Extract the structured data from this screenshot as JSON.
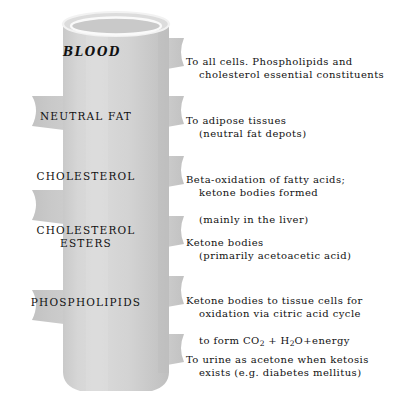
{
  "figure": {
    "vessel_label": "blood-vessel-cylinder",
    "colors": {
      "vessel_fill": "#d2d2d2",
      "vessel_shade": "#c4c4c4",
      "vessel_highlight": "#ededed",
      "rim_stroke": "#f5f5f5",
      "text": "#111111",
      "background": "#ffffff"
    }
  },
  "labels": [
    {
      "id": "blood",
      "text": "BLOOD",
      "style": "italic"
    },
    {
      "id": "neutral-fat",
      "text": "NEUTRAL  FAT",
      "style": "roman"
    },
    {
      "id": "cholesterol",
      "text": "CHOLESTEROL",
      "style": "roman"
    },
    {
      "id": "cholesterol-esters",
      "text": "CHOLESTEROL\nESTERS",
      "style": "roman"
    },
    {
      "id": "phospholipids",
      "text": "PHOSPHOLIPIDS",
      "style": "roman"
    }
  ],
  "descriptions": [
    {
      "id": "to-all-cells",
      "line1": "To all cells. Phospholipids and",
      "line2": "cholesterol essential constituents",
      "line3": "",
      "formula": false
    },
    {
      "id": "adipose-tissues",
      "line1": "To adipose tissues",
      "line2": "(neutral fat depots)",
      "line3": "",
      "formula": false
    },
    {
      "id": "beta-oxidation",
      "line1": "Beta-oxidation of fatty acids;",
      "line2": "ketone bodies formed",
      "line3": "(mainly in the liver)",
      "formula": false
    },
    {
      "id": "ketone-bodies",
      "line1": "Ketone bodies",
      "line2": "(primarily acetoacetic acid)",
      "line3": "",
      "formula": false
    },
    {
      "id": "citric-acid-cycle",
      "line1": "Ketone bodies to tissue cells for",
      "line2": "oxidation via citric acid cycle",
      "line3": "to form CO2 + H2O+energy",
      "formula": true,
      "formula_prefix": "to form CO",
      "formula_sub1": "2",
      "formula_mid": " + H",
      "formula_sub2": "2",
      "formula_suffix": "O+energy"
    },
    {
      "id": "urine-acetone",
      "line1": "To urine as acetone when ketosis",
      "line2": "exists (e.g. diabetes mellitus)",
      "line3": "",
      "formula": false
    }
  ]
}
